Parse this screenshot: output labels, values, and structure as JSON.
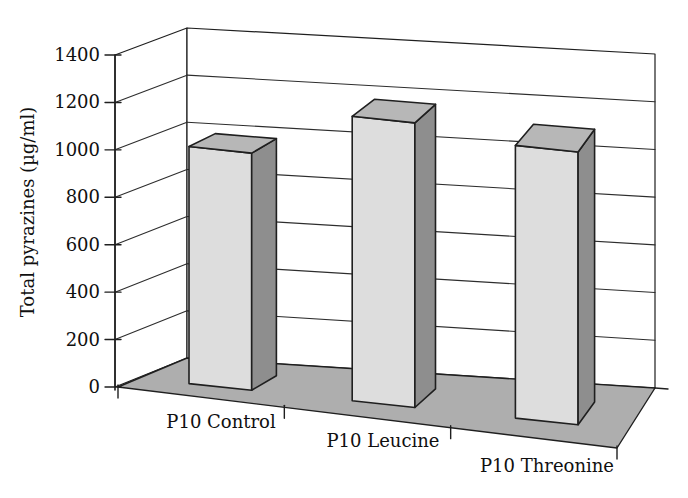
{
  "chart_data": {
    "type": "bar",
    "variant": "3d-column",
    "title": "",
    "xlabel": "",
    "ylabel": "Total pyrazines (µg/ml)",
    "categories": [
      "P10 Control",
      "P10 Leucine",
      "P10 Threonine"
    ],
    "values": [
      1000,
      1200,
      1150
    ],
    "ylim": [
      0,
      1400
    ],
    "ytick_step": 200,
    "yticks": [
      0,
      200,
      400,
      600,
      800,
      1000,
      1200,
      1400
    ],
    "grid": true,
    "legend_position": "none",
    "colors": {
      "background": "#ffffff",
      "wall": "#ffffff",
      "floor": "#aeaeae",
      "bar_front": "#dddddd",
      "bar_top": "#b7b7b7",
      "bar_side": "#8e8e8e",
      "outline": "#1f1f1f",
      "gridline": "#2d2d2d",
      "text": "#101010"
    }
  }
}
